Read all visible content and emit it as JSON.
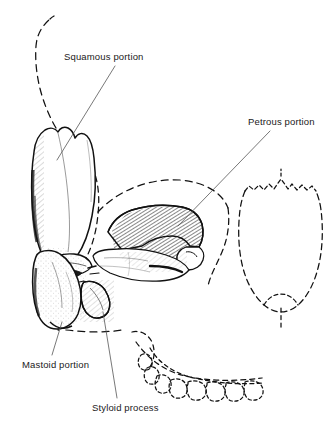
{
  "figure": {
    "background_color": "#ffffff",
    "ink_color": "#141414",
    "leader_color": "#555555",
    "width": 334,
    "height": 426
  },
  "labels": {
    "squamous": "Squamous portion",
    "petrous": "Petrous portion",
    "mastoid": "Mastoid portion",
    "styloid": "Styloid process"
  },
  "annotations": [
    {
      "id": "squamous",
      "text": "Squamous portion",
      "label_x": 64,
      "label_y": 52,
      "leader_from_x": 115,
      "leader_from_y": 66,
      "leader_to_x": 57,
      "leader_to_y": 160
    },
    {
      "id": "petrous",
      "text": "Petrous portion",
      "label_x": 248,
      "label_y": 117,
      "leader_from_x": 270,
      "leader_from_y": 131,
      "leader_to_x": 178,
      "leader_to_y": 226
    },
    {
      "id": "mastoid",
      "text": "Mastoid portion",
      "label_x": 22,
      "label_y": 360,
      "leader_from_x": 52,
      "leader_from_y": 355,
      "leader_to_x": 62,
      "leader_to_y": 322
    },
    {
      "id": "styloid",
      "text": "Styloid process",
      "label_x": 92,
      "label_y": 403,
      "leader_from_x": 117,
      "leader_from_y": 398,
      "leader_to_x": 103,
      "leader_to_y": 312
    }
  ],
  "regions": [
    {
      "id": "squamous-plate",
      "name": "Squamous portion",
      "style": "solid outline, unshaded"
    },
    {
      "id": "petrous-pyramid",
      "name": "Petrous portion",
      "style": "solid outline, dense diagonal hatching"
    },
    {
      "id": "mastoid-process",
      "name": "Mastoid portion",
      "style": "solid outline, stipple shading"
    },
    {
      "id": "styloid-spine",
      "name": "Styloid process",
      "style": "solid outline, small tapering spine"
    },
    {
      "id": "cranial-vault",
      "name": "Cranial vault contour",
      "style": "dashed ghost outline"
    },
    {
      "id": "occipital-arc",
      "name": "Occipital contour",
      "style": "dashed ghost outline"
    },
    {
      "id": "palate",
      "name": "Hard palate",
      "style": "dashed ghost outline"
    },
    {
      "id": "dental-arcade",
      "name": "Maxillary dental arcade",
      "style": "dashed ghost outline"
    }
  ]
}
